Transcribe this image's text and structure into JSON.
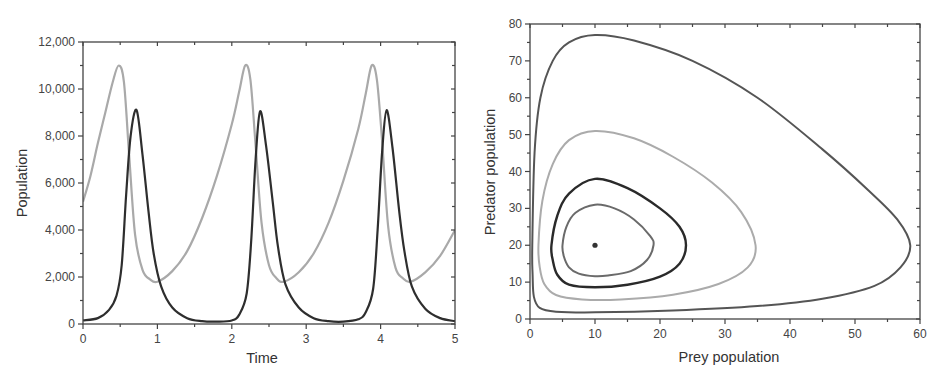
{
  "chart_data": [
    {
      "type": "line",
      "title": "",
      "xlabel": "Time",
      "ylabel": "Population",
      "xlim": [
        0,
        5
      ],
      "ylim": [
        0,
        12000
      ],
      "xticks": [
        0,
        1,
        2,
        3,
        4,
        5
      ],
      "xtick_labels": [
        "0",
        "1",
        "2",
        "3",
        "4",
        "5"
      ],
      "yticks": [
        0,
        2000,
        4000,
        6000,
        8000,
        10000,
        12000
      ],
      "ytick_labels": [
        "0",
        "2,000",
        "4,000",
        "6,000",
        "8,000",
        "10,000",
        "12,000"
      ],
      "grid": false,
      "legend": null,
      "series": [
        {
          "name": "Prey",
          "color": "#a9a9a9",
          "x": [
            0,
            0.1,
            0.2,
            0.3,
            0.4,
            0.48,
            0.55,
            0.62,
            0.7,
            0.8,
            0.9,
            1.0,
            1.2,
            1.4,
            1.6,
            1.8,
            2.0,
            2.1,
            2.18,
            2.25,
            2.32,
            2.4,
            2.5,
            2.6,
            2.7,
            2.9,
            3.1,
            3.3,
            3.5,
            3.7,
            3.8,
            3.88,
            3.95,
            4.02,
            4.1,
            4.2,
            4.3,
            4.4,
            4.6,
            4.8,
            5.0
          ],
          "y": [
            5200,
            6300,
            7700,
            9000,
            10300,
            11000,
            10300,
            7200,
            3800,
            2300,
            1900,
            1800,
            2250,
            3100,
            4500,
            6300,
            8500,
            9900,
            11000,
            10400,
            7600,
            4300,
            2500,
            1950,
            1800,
            2200,
            3000,
            4300,
            6100,
            8300,
            9800,
            11000,
            10400,
            7800,
            4200,
            2400,
            1950,
            1800,
            2200,
            2900,
            4000
          ]
        },
        {
          "name": "Predator",
          "color": "#2e2e2e",
          "x": [
            0,
            0.2,
            0.35,
            0.45,
            0.52,
            0.58,
            0.64,
            0.72,
            0.8,
            0.88,
            0.95,
            1.05,
            1.2,
            1.4,
            1.6,
            1.8,
            2.0,
            2.1,
            2.2,
            2.26,
            2.32,
            2.38,
            2.46,
            2.55,
            2.62,
            2.72,
            2.9,
            3.1,
            3.3,
            3.5,
            3.7,
            3.8,
            3.9,
            3.96,
            4.02,
            4.08,
            4.16,
            4.25,
            4.32,
            4.42,
            4.6,
            4.8,
            5.0
          ],
          "y": [
            150,
            250,
            600,
            1200,
            2500,
            5500,
            8000,
            9100,
            7200,
            4800,
            3000,
            1600,
            700,
            250,
            120,
            100,
            150,
            400,
            1300,
            3500,
            7000,
            9050,
            7600,
            5200,
            3300,
            1700,
            700,
            250,
            120,
            100,
            200,
            500,
            1500,
            4000,
            7300,
            9100,
            7500,
            4800,
            3100,
            1600,
            650,
            250,
            120
          ]
        }
      ]
    },
    {
      "type": "line",
      "title": "",
      "xlabel": "Prey population",
      "ylabel": "Predator population",
      "xlim": [
        0,
        60
      ],
      "ylim": [
        0,
        80
      ],
      "xticks": [
        0,
        10,
        20,
        30,
        40,
        50,
        60
      ],
      "xtick_labels": [
        "0",
        "10",
        "20",
        "30",
        "40",
        "50",
        "60"
      ],
      "yticks": [
        0,
        10,
        20,
        30,
        40,
        50,
        60,
        70,
        80
      ],
      "ytick_labels": [
        "0",
        "10",
        "20",
        "30",
        "40",
        "50",
        "60",
        "70",
        "80"
      ],
      "grid": false,
      "legend": null,
      "equilibrium_point": {
        "x": 10,
        "y": 20,
        "color": "#333333"
      },
      "series": [
        {
          "name": "Orbit 1",
          "color": "#6a6a6a",
          "closed": true,
          "points": [
            [
              5,
              20
            ],
            [
              5.6,
              25
            ],
            [
              7,
              28.8
            ],
            [
              10,
              31
            ],
            [
              13,
              30
            ],
            [
              16,
              27
            ],
            [
              18.5,
              22.5
            ],
            [
              19,
              20
            ],
            [
              18,
              16
            ],
            [
              15.5,
              13
            ],
            [
              12,
              11.8
            ],
            [
              10,
              11.6
            ],
            [
              7.5,
              12.3
            ],
            [
              6,
              14
            ],
            [
              5.2,
              17
            ]
          ]
        },
        {
          "name": "Orbit 2",
          "color": "#2a2a2a",
          "closed": true,
          "points": [
            [
              3.3,
              20
            ],
            [
              4.2,
              28
            ],
            [
              6,
              34
            ],
            [
              10,
              38
            ],
            [
              15,
              35.5
            ],
            [
              20,
              30
            ],
            [
              23,
              25
            ],
            [
              24,
              20
            ],
            [
              23,
              15
            ],
            [
              20,
              11.5
            ],
            [
              15,
              9.3
            ],
            [
              10,
              8.6
            ],
            [
              6,
              9.3
            ],
            [
              4.2,
              12
            ],
            [
              3.5,
              16
            ]
          ]
        },
        {
          "name": "Orbit 3",
          "color": "#ababab",
          "closed": true,
          "points": [
            [
              1.3,
              20
            ],
            [
              1.9,
              32
            ],
            [
              3.5,
              42
            ],
            [
              6,
              48.5
            ],
            [
              10,
              51
            ],
            [
              16,
              49
            ],
            [
              22,
              44
            ],
            [
              28,
              37
            ],
            [
              32.5,
              29
            ],
            [
              34.7,
              20
            ],
            [
              33.5,
              14
            ],
            [
              29,
              9.5
            ],
            [
              22,
              6.6
            ],
            [
              14,
              5.3
            ],
            [
              8,
              5.3
            ],
            [
              4,
              6.5
            ],
            [
              2.2,
              9.5
            ],
            [
              1.5,
              14
            ]
          ]
        },
        {
          "name": "Orbit 4",
          "color": "#555555",
          "closed": true,
          "points": [
            [
              0.35,
              20
            ],
            [
              0.7,
              45
            ],
            [
              1.6,
              60
            ],
            [
              3.5,
              70
            ],
            [
              6,
              75
            ],
            [
              10,
              77
            ],
            [
              16,
              75.5
            ],
            [
              25,
              70
            ],
            [
              35,
              60
            ],
            [
              45,
              46
            ],
            [
              52,
              35
            ],
            [
              56.5,
              27
            ],
            [
              58.5,
              20
            ],
            [
              57,
              14
            ],
            [
              53,
              9
            ],
            [
              45,
              5.5
            ],
            [
              35,
              3.5
            ],
            [
              22,
              2.3
            ],
            [
              10,
              1.8
            ],
            [
              4,
              2
            ],
            [
              1.5,
              3
            ],
            [
              0.6,
              6
            ],
            [
              0.4,
              12
            ]
          ]
        }
      ]
    }
  ]
}
